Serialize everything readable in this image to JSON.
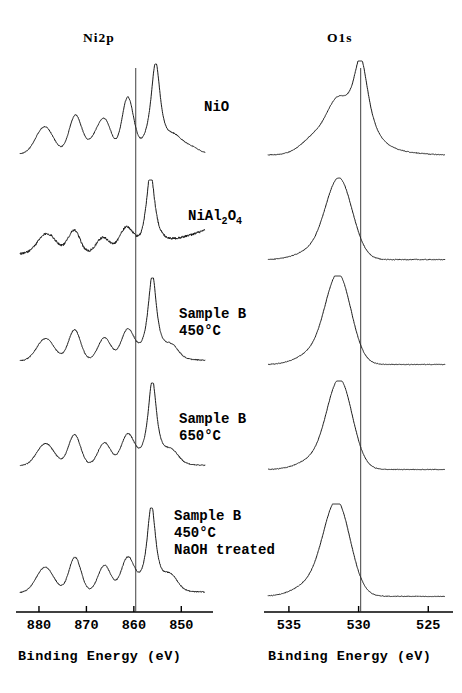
{
  "figure": {
    "title_ni": "Ni2p",
    "title_o": "O1s",
    "type": "xps-spectra-stack"
  },
  "panels": [
    {
      "id": "ni2p",
      "header": "Ni2p",
      "axis_label": "Binding  Energy  (eV)",
      "ticks": [
        "880",
        "870",
        "860",
        "850"
      ],
      "tick_values": [
        880,
        870,
        860,
        850
      ],
      "xmin": 845,
      "xmax": 884,
      "reference_line_ev": 859.6
    },
    {
      "id": "o1s",
      "header": "O1s",
      "axis_label": "Binding  Energy  (eV)",
      "ticks": [
        "535",
        "530",
        "525"
      ],
      "tick_values": [
        535,
        530,
        525
      ],
      "xmin": 523.8,
      "xmax": 536.5,
      "reference_line_ev": 529.85
    }
  ],
  "traces": [
    {
      "label_html": "NiO",
      "label_lines": [
        "NiO"
      ],
      "temperature": "",
      "treatment": ""
    },
    {
      "label_html": "NiAl2O4",
      "label_lines": [
        "NiAl",
        "2",
        "O",
        "4"
      ],
      "temperature": "",
      "treatment": ""
    },
    {
      "label_html": "Sample B 450C",
      "label_lines": [
        "Sample B",
        "450°C"
      ],
      "temperature": "450°C",
      "treatment": ""
    },
    {
      "label_html": "Sample B 650C",
      "label_lines": [
        "Sample B",
        "650°C"
      ],
      "temperature": "650°C",
      "treatment": ""
    },
    {
      "label_html": "Sample B 450C NaOH treated",
      "label_lines": [
        "Sample B",
        "450°C",
        "NaOH treated"
      ],
      "temperature": "450°C",
      "treatment": "NaOH treated"
    }
  ],
  "labels": {
    "nio": "NiO",
    "nial_main": "NiAl",
    "nial_sub2": "2",
    "nial_o": "O",
    "nial_sub4": "4",
    "sampleb": "Sample B",
    "t450": "450°C",
    "t650": "650°C",
    "naoh": "NaOH treated"
  },
  "colors": {
    "trace": "#1a1a1a",
    "axis": "#000000",
    "background": "#ffffff",
    "reference_line": "#2b2b2b"
  },
  "chart_data": {
    "type": "line",
    "xlabel": "Binding Energy (eV)",
    "ylabel": "Intensity (a.u.)",
    "grid": false,
    "legend": "none",
    "panels": [
      {
        "name": "Ni2p",
        "xlim": [
          884,
          845
        ],
        "xticks": [
          880,
          870,
          860,
          850
        ],
        "reference_line": 859.6,
        "series": [
          {
            "name": "NiO",
            "peaks_ev": [
              878.5,
              872.2,
              866.0,
              861.0,
              855.4,
              851.0
            ],
            "peak_labels": [
              "2p1/2 satellite",
              "2p1/2",
              "2p3/2 satellite",
              "2p3/2 shoulder",
              "2p3/2 main",
              "tail"
            ],
            "relative_heights": [
              0.3,
              0.42,
              0.28,
              0.55,
              1.0,
              0.13
            ]
          },
          {
            "name": "NiAl2O4",
            "peaks_ev": [
              878.0,
              872.5,
              866.5,
              861.5,
              856.4
            ],
            "peak_labels": [
              "2p1/2 satellite",
              "2p1/2",
              "2p3/2 satellite",
              "shoulder",
              "2p3/2 main"
            ],
            "relative_heights": [
              0.3,
              0.33,
              0.22,
              0.3,
              1.0
            ]
          },
          {
            "name": "Sample B 450C",
            "peaks_ev": [
              878.5,
              872.5,
              866.0,
              861.2,
              856.0
            ],
            "peak_labels": [
              "2p1/2 satellite",
              "2p1/2",
              "2p3/2 satellite",
              "shoulder",
              "2p3/2 main"
            ],
            "relative_heights": [
              0.28,
              0.36,
              0.26,
              0.34,
              1.0
            ]
          },
          {
            "name": "Sample B 650C",
            "peaks_ev": [
              878.6,
              872.6,
              866.2,
              861.3,
              856.1
            ],
            "peak_labels": [
              "2p1/2 satellite",
              "2p1/2",
              "2p3/2 satellite",
              "shoulder",
              "2p3/2 main"
            ],
            "relative_heights": [
              0.28,
              0.38,
              0.27,
              0.33,
              1.0
            ]
          },
          {
            "name": "Sample B 450C NaOH treated",
            "peaks_ev": [
              878.6,
              872.4,
              866.2,
              861.3,
              856.3,
              852.0
            ],
            "peak_labels": [
              "2p1/2 satellite",
              "2p1/2",
              "2p3/2 satellite",
              "shoulder",
              "2p3/2 main",
              "tail"
            ],
            "relative_heights": [
              0.3,
              0.4,
              0.3,
              0.36,
              1.0,
              0.14
            ]
          }
        ]
      },
      {
        "name": "O1s",
        "xlim": [
          536.5,
          523.8
        ],
        "xticks": [
          535,
          530,
          525
        ],
        "reference_line": 529.85,
        "series": [
          {
            "name": "NiO",
            "peaks_ev": [
              529.8,
              531.6
            ],
            "peak_labels": [
              "lattice oxide",
              "hydroxyl shoulder"
            ],
            "relative_heights": [
              1.0,
              0.42
            ]
          },
          {
            "name": "NiAl2O4",
            "peaks_ev": [
              531.4
            ],
            "peak_labels": [
              "aluminate oxygen"
            ],
            "relative_heights": [
              1.0
            ]
          },
          {
            "name": "Sample B 450C",
            "peaks_ev": [
              531.4
            ],
            "peak_labels": [
              "oxide/hydroxyl"
            ],
            "relative_heights": [
              1.0
            ]
          },
          {
            "name": "Sample B 650C",
            "peaks_ev": [
              531.3
            ],
            "peak_labels": [
              "oxide/hydroxyl"
            ],
            "relative_heights": [
              1.0
            ]
          },
          {
            "name": "Sample B 450C NaOH treated",
            "peaks_ev": [
              531.5
            ],
            "peak_labels": [
              "oxide/hydroxyl"
            ],
            "relative_heights": [
              1.0
            ]
          }
        ]
      }
    ]
  }
}
